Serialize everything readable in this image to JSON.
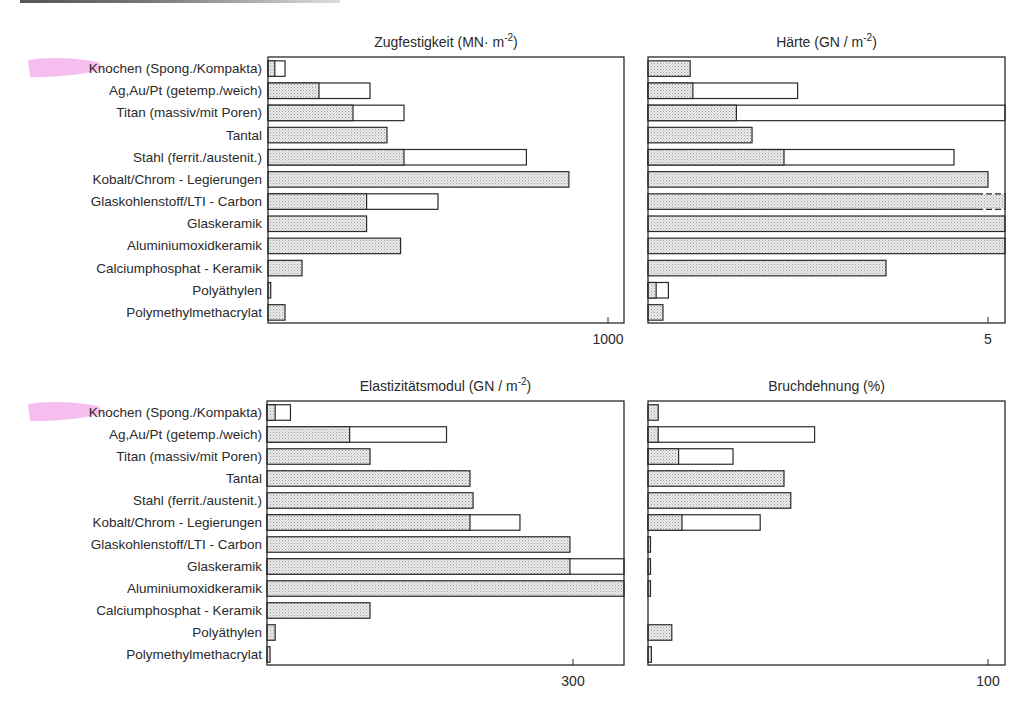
{
  "chart_data": [
    {
      "type": "bar",
      "orientation": "horizontal",
      "title": "Zugfestigkeit (MN m⁻²)",
      "title_main": "Zugfestigkeit",
      "title_unit": "(MN· m",
      "title_exp": "-2",
      "title_close": ")",
      "xlim": [
        0,
        1050
      ],
      "ticks": [
        {
          "value": 1000,
          "label": "1000"
        }
      ],
      "categories": [
        "Knochen (Spong./Kompakta)",
        "Ag, Au/Pt (getemp./weich)",
        "Titan (massiv/mit Poren)",
        "Tantal",
        "Stahl (ferrit./austenit.)",
        "Kobalt/Chrom - Legierungen",
        "Glaskohlenstoff/LTI - Carbon",
        "Glaskeramik",
        "Aluminiumoxidkeramik",
        "Calciumphosphat - Keramik",
        "Polyäthylen",
        "Polymethylmethacrylat"
      ],
      "series": [
        {
          "name": "min (gefüllt)",
          "values": [
            20,
            150,
            250,
            350,
            400,
            885,
            290,
            290,
            390,
            100,
            8,
            50
          ]
        },
        {
          "name": "max (Umriss)",
          "values": [
            50,
            300,
            400,
            350,
            760,
            885,
            500,
            290,
            390,
            100,
            8,
            50
          ]
        }
      ],
      "exceeds_axis": []
    },
    {
      "type": "bar",
      "orientation": "horizontal",
      "title": "Härte (GN/m⁻²)",
      "title_main": "Härte",
      "title_unit": "(GN / m",
      "title_exp": "-2",
      "title_close": ")",
      "xlim": [
        0,
        5.25
      ],
      "ticks": [
        {
          "value": 5,
          "label": "5"
        }
      ],
      "categories": [
        "Knochen (Spong./Kompakta)",
        "Ag, Au/Pt (getemp./weich)",
        "Titan (massiv/mit Poren)",
        "Tantal",
        "Stahl (ferrit./austenit.)",
        "Kobalt/Chrom - Legierungen",
        "Glaskohlenstoff/LTI - Carbon",
        "Glaskeramik",
        "Aluminiumoxidkeramik",
        "Calciumphosphat - Keramik",
        "Polyäthylen",
        "Polymethylmethacrylat"
      ],
      "series": [
        {
          "name": "min (gefüllt)",
          "values": [
            0.62,
            0.66,
            1.3,
            1.53,
            2.0,
            5.0,
            5.25,
            5.25,
            5.25,
            3.5,
            0.12,
            0.22
          ]
        },
        {
          "name": "max (Umriss)",
          "values": [
            0.62,
            2.2,
            5.25,
            1.53,
            4.5,
            5.0,
            5.25,
            5.25,
            5.25,
            3.5,
            0.3,
            0.22
          ]
        }
      ],
      "exceeds_axis": [
        "Titan (massiv/mit Poren)",
        "Glaskohlenstoff/LTI - Carbon",
        "Glaskeramik",
        "Aluminiumoxidkeramik"
      ],
      "dashed_end": [
        "Glaskohlenstoff/LTI - Carbon"
      ]
    },
    {
      "type": "bar",
      "orientation": "horizontal",
      "title": "Elastizitätsmodul (GN/m⁻²)",
      "title_main": "Elastizitätsmodul",
      "title_unit": "(GN / m",
      "title_exp": "-2",
      "title_close": ")",
      "xlim": [
        0,
        350
      ],
      "ticks": [
        {
          "value": 300,
          "label": "300"
        }
      ],
      "categories": [
        "Knochen (Spong./Kompakta)",
        "Ag, Au/Pt (getemp./weich)",
        "Titan (massiv/mit Poren)",
        "Tantal",
        "Stahl (ferrit./austenit.)",
        "Kobalt/Chrom - Legierungen",
        "Glaskohlenstoff/LTI - Carbon",
        "Glaskeramik",
        "Aluminiumoxidkeramik",
        "Calciumphosphat - Keramik",
        "Polyäthylen",
        "Polymethylmethacrylat"
      ],
      "series": [
        {
          "name": "min (gefüllt)",
          "values": [
            8,
            81,
            101,
            199,
            202,
            199,
            297,
            297,
            350,
            101,
            8,
            3
          ]
        },
        {
          "name": "max (Umriss)",
          "values": [
            23,
            176,
            101,
            199,
            202,
            248,
            297,
            350,
            350,
            101,
            8,
            3
          ]
        }
      ],
      "exceeds_axis": [
        "Glaskeramik",
        "Aluminiumoxidkeramik"
      ]
    },
    {
      "type": "bar",
      "orientation": "horizontal",
      "title": "Bruchdehnung (%)",
      "title_main": "Bruchdehnung",
      "title_unit": "(%",
      "title_exp": "",
      "title_close": ")",
      "xlim": [
        0,
        105
      ],
      "ticks": [
        {
          "value": 100,
          "label": "100"
        }
      ],
      "categories": [
        "Knochen (Spong./Kompakta)",
        "Ag, Au/Pt (getemp./weich)",
        "Titan (massiv/mit Poren)",
        "Tantal",
        "Stahl (ferrit./austenit.)",
        "Kobalt/Chrom - Legierungen",
        "Glaskohlenstoff/LTI - Carbon",
        "Glaskeramik",
        "Aluminiumoxidkeramik",
        "Calciumphosphat - Keramik",
        "Polyäthylen",
        "Polymethylmethacrylat"
      ],
      "series": [
        {
          "name": "min (gefüllt)",
          "values": [
            3,
            3,
            9,
            40,
            42,
            10,
            0.5,
            0.5,
            0.5,
            0,
            7,
            1
          ]
        },
        {
          "name": "max (Umriss)",
          "values": [
            3,
            49,
            25,
            40,
            42,
            33,
            0.5,
            0.5,
            0.5,
            0,
            7,
            1
          ]
        }
      ],
      "exceeds_axis": []
    }
  ],
  "row_labels": [
    "Knochen",
    "Ag,Au/Pt (getemp./weich)",
    "Titan (massiv/mit Poren)",
    "Tantal",
    "Stahl (ferrit./austenit.)",
    "Kobalt/Chrom - Legierungen",
    "Glaskohlenstoff/LTI - Carbon",
    "Glaskeramik",
    "Aluminiumoxidkeramik",
    "Calciumphosphat - Keramik",
    "Polyäthylen",
    "Polymethylmethacrylat"
  ],
  "first_label_suffix": " (Spong./Kompakta)",
  "highlighted_label": "Knochen",
  "colors": {
    "ink": "#2a2a2a",
    "highlight": "#f2a8e8",
    "dot_fill": "#e4e4e4"
  }
}
